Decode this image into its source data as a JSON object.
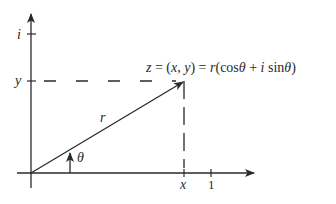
{
  "diagram": {
    "axes": {
      "imag_axis_label": "i",
      "y_tick_label": "y",
      "x_tick_label": "x",
      "unit_tick_label": "1"
    },
    "vector_label": "r",
    "angle_label": "θ",
    "formula": {
      "z": "z",
      "eq1": " = (",
      "x": "x",
      "comma": ", ",
      "y": "y",
      "eq2": ") = ",
      "r": "r",
      "cos": "(cos",
      "theta1": "θ",
      "plus": " + ",
      "i": "i",
      "sin": " sin",
      "theta2": "θ",
      "close": ")"
    },
    "colors": {
      "line": "#2a2a2a",
      "background": "#ffffff"
    }
  }
}
